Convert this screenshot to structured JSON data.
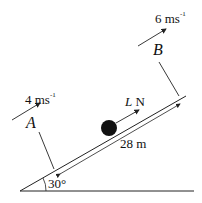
{
  "diagram": {
    "speed_a": {
      "value": "4 ms",
      "exp": "-1"
    },
    "speed_b": {
      "value": "6 ms",
      "exp": "-1"
    },
    "point_a": "A",
    "point_b": "B",
    "force": {
      "symbol": "L",
      "unit": " N"
    },
    "distance": "28 m",
    "angle": "30°",
    "colors": {
      "line": "#222222",
      "ball": "#111111"
    }
  }
}
